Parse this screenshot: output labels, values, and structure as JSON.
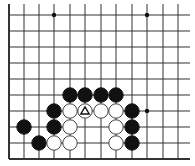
{
  "diagram": {
    "type": "go-board-fragment",
    "background": "#ffffff",
    "line_color": "#333333",
    "columns_x": [
      9,
      24,
      39,
      54,
      70,
      85,
      101,
      116,
      132,
      147,
      163,
      178
    ],
    "rows_y": [
      15,
      31,
      47,
      63,
      79,
      95,
      111,
      127,
      143,
      159
    ],
    "left_edge": true,
    "bottom_edge": true,
    "stone_radius": 7.2,
    "star_points": [
      [
        3,
        0
      ],
      [
        9,
        0
      ],
      [
        9,
        6
      ]
    ],
    "stones": [
      {
        "color": "black",
        "col": 4,
        "row": 5
      },
      {
        "color": "black",
        "col": 5,
        "row": 5
      },
      {
        "color": "black",
        "col": 6,
        "row": 5
      },
      {
        "color": "black",
        "col": 7,
        "row": 5
      },
      {
        "color": "black",
        "col": 3,
        "row": 6
      },
      {
        "color": "white",
        "col": 4,
        "row": 6
      },
      {
        "color": "white",
        "col": 5,
        "row": 6,
        "marker": "triangle"
      },
      {
        "color": "white",
        "col": 6,
        "row": 6
      },
      {
        "color": "white",
        "col": 7,
        "row": 6
      },
      {
        "color": "black",
        "col": 8,
        "row": 6
      },
      {
        "color": "black",
        "col": 1,
        "row": 7
      },
      {
        "color": "black",
        "col": 3,
        "row": 7
      },
      {
        "color": "white",
        "col": 4,
        "row": 7
      },
      {
        "color": "white",
        "col": 7,
        "row": 7
      },
      {
        "color": "black",
        "col": 8,
        "row": 7
      },
      {
        "color": "black",
        "col": 2,
        "row": 8
      },
      {
        "color": "white",
        "col": 3,
        "row": 8
      },
      {
        "color": "white",
        "col": 4,
        "row": 8
      },
      {
        "color": "white",
        "col": 7,
        "row": 8
      },
      {
        "color": "black",
        "col": 8,
        "row": 8
      }
    ]
  }
}
